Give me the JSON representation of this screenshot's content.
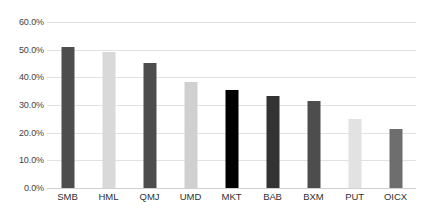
{
  "chart_data": {
    "type": "bar",
    "title": "",
    "subtitle": "",
    "xlabel": "",
    "ylabel": "",
    "categories": [
      "SMB",
      "HML",
      "QMJ",
      "UMD",
      "MKT",
      "BAB",
      "BXM",
      "PUT",
      "OICX"
    ],
    "values": [
      51.0,
      49.3,
      45.3,
      38.2,
      35.4,
      33.3,
      31.3,
      24.9,
      21.2
    ],
    "value_labels": [
      "51.0%",
      "49.3%",
      "45.3%",
      "38.2%",
      "35.4%",
      "33.3%",
      "31.3%",
      "24.9%",
      "21.2%"
    ],
    "bar_colors": [
      "#4d4d4d",
      "#d9d9d9",
      "#4d4d4d",
      "#d0d0d0",
      "#000000",
      "#333333",
      "#4d4d4d",
      "#e2e2e2",
      "#6e6e6e"
    ],
    "ylim": [
      0.0,
      60.0
    ],
    "ytick_values": [
      0.0,
      10.0,
      20.0,
      30.0,
      40.0,
      50.0,
      60.0
    ],
    "ytick_labels": [
      "0.0%",
      "10.0%",
      "20.0%",
      "30.0%",
      "40.0%",
      "50.0%",
      "60.0%"
    ],
    "grid": true,
    "grid_axis": "y",
    "legend": false,
    "legend_position": "none",
    "annotations": [],
    "colors": {
      "gridline": "#e2e2e2",
      "baseline": "#d0d0d0",
      "tick_text": "#3f3f3f",
      "category_text": "#2f2f2f",
      "background": "#ffffff"
    }
  }
}
